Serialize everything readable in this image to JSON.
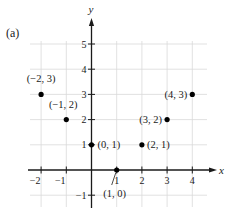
{
  "panel_label": "(a)",
  "chart_data": {
    "type": "scatter",
    "title": "",
    "xlabel": "x",
    "ylabel": "y",
    "xlim": [
      -2.5,
      4.6
    ],
    "ylim": [
      -1.5,
      5.5
    ],
    "grid": true,
    "x_ticks": [
      -2,
      -1,
      1,
      2,
      3,
      4
    ],
    "y_ticks": [
      -1,
      1,
      2,
      3,
      4,
      5
    ],
    "x_tick_labels": [
      "−2",
      "−1",
      "1",
      "2",
      "3",
      "4"
    ],
    "y_tick_labels": [
      "−1",
      "1",
      "2",
      "3",
      "4",
      "5"
    ],
    "points": [
      {
        "x": -2,
        "y": 3,
        "label": "(−2, 3)"
      },
      {
        "x": -1,
        "y": 2,
        "label": "(−1, 2)"
      },
      {
        "x": 0,
        "y": 1,
        "label": "(0, 1)"
      },
      {
        "x": 1,
        "y": 0,
        "label": "(1, 0)"
      },
      {
        "x": 2,
        "y": 1,
        "label": "(2, 1)"
      },
      {
        "x": 3,
        "y": 2,
        "label": "(3, 2)"
      },
      {
        "x": 4,
        "y": 3,
        "label": "(4, 3)"
      }
    ],
    "colors": {
      "axis": "#1a1a1a",
      "grid": "#d9d9d9",
      "point": "#000000"
    }
  }
}
